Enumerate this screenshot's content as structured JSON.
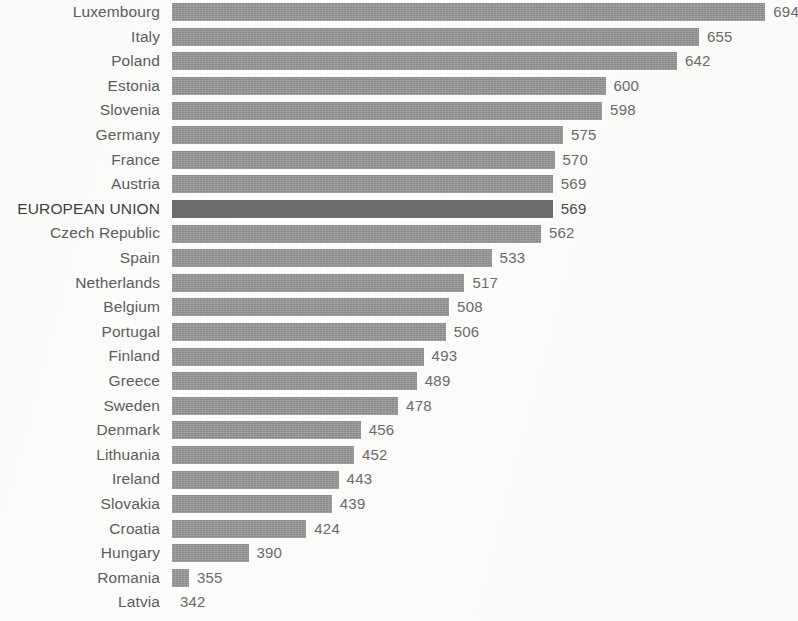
{
  "chart_data": {
    "type": "bar",
    "orientation": "horizontal",
    "title": "",
    "subtitle": "",
    "xlabel": "",
    "ylabel": "",
    "grid": false,
    "legend": null,
    "axis_note": "Horizontal bars drawn from a truncated (non-zero) baseline of approximately 345; bar lengths are proportional to value minus baseline. Bottom category (Latvia) bar is cropped off the visible image area, only its value label is shown.",
    "baseline_value": 345,
    "xlim": [
      345,
      700
    ],
    "highlighted_category": "EUROPEAN UNION",
    "highlight_color": "#6d6d6d",
    "bar_color": "#969696",
    "label_color": "#5d5d5d",
    "value_label_color": "#6a6a6a",
    "background_color": "#fcfcfb",
    "categories": [
      "Luxembourg",
      "Italy",
      "Poland",
      "Estonia",
      "Slovenia",
      "Germany",
      "France",
      "Austria",
      "EUROPEAN UNION",
      "Czech Republic",
      "Spain",
      "Netherlands",
      "Belgium",
      "Portugal",
      "Finland",
      "Greece",
      "Sweden",
      "Denmark",
      "Lithuania",
      "Ireland",
      "Slovakia",
      "Croatia",
      "Hungary",
      "Romania",
      "Latvia"
    ],
    "values": [
      694,
      655,
      642,
      600,
      598,
      575,
      570,
      569,
      569,
      562,
      533,
      517,
      508,
      506,
      493,
      489,
      478,
      456,
      452,
      443,
      439,
      424,
      390,
      355,
      342
    ],
    "value_labels": [
      "694",
      "655",
      "642",
      "600",
      "598",
      "575",
      "570",
      "569",
      "569",
      "562",
      "533",
      "517",
      "508",
      "506",
      "493",
      "489",
      "478",
      "456",
      "452",
      "443",
      "439",
      "424",
      "390",
      "355",
      "342"
    ]
  }
}
